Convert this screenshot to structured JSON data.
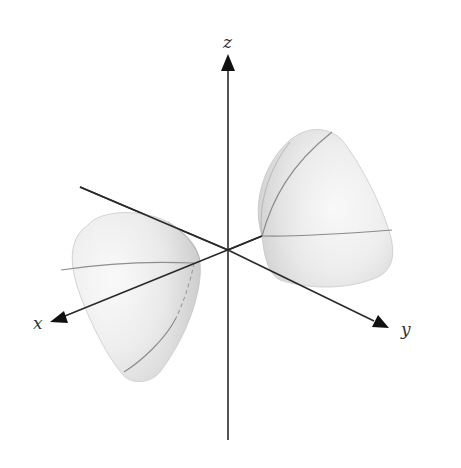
{
  "figure": {
    "axes": {
      "x_label": "x",
      "y_label": "y",
      "z_label": "z"
    },
    "colors": {
      "axis": "#2a2a2a",
      "surface_light": "#f6f6f6",
      "surface_mid": "#e2e2e2",
      "surface_dark": "#c9c9c9",
      "trace": "#8a8a8a",
      "label": "#333333"
    }
  }
}
